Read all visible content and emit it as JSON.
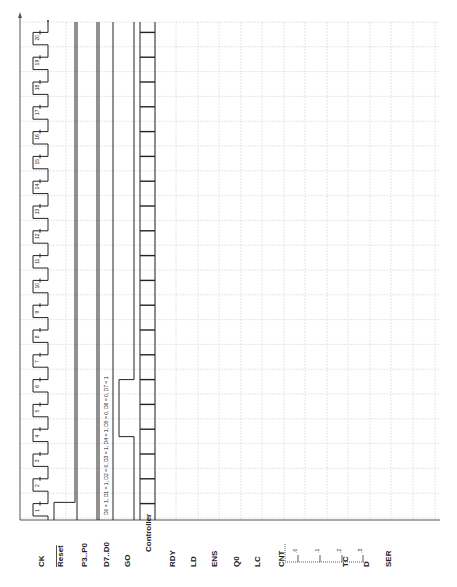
{
  "orientation": "rotated-90-ccw",
  "signals": [
    {
      "name": "CK",
      "overline": false
    },
    {
      "name": "Reset",
      "overline": true
    },
    {
      "name": "P3..P0",
      "overline": false
    },
    {
      "name": "D7..D0",
      "overline": false
    },
    {
      "name": "GO",
      "overline": false
    },
    {
      "name": "Controller",
      "overline": false
    },
    {
      "name": "RDY",
      "overline": false
    },
    {
      "name": "LD",
      "overline": false
    },
    {
      "name": "ENS",
      "overline": false
    },
    {
      "name": "Q0",
      "overline": false
    },
    {
      "name": "LC",
      "overline": false
    },
    {
      "name": "CNT",
      "overline": false
    },
    {
      "name": "TC",
      "overline": false
    },
    {
      "name": "D",
      "overline": false
    },
    {
      "name": "SER",
      "overline": false
    }
  ],
  "cnt_states": [
    "0",
    "1",
    "2",
    "3"
  ],
  "clock_cycles": [
    "1",
    "2",
    "3",
    "4",
    "5",
    "6",
    "7",
    "8",
    "9",
    "10",
    "11",
    "12",
    "13",
    "14",
    "15",
    "16",
    "17",
    "18",
    "19",
    "20"
  ],
  "annotation": "D0 = 1, D1 = 1, D2 = 0, D3 = 1, D4 = 1, D5 = 0, D6 = 0, D7 = 1",
  "colors": {
    "grid": "#cfcfcf",
    "wave": "#222222",
    "axis": "#555555"
  }
}
